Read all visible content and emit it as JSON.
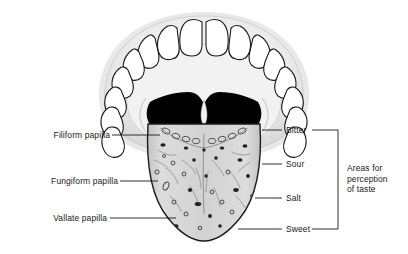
{
  "figure": {
    "background_color": "#ffffff",
    "line_color": "#1a1a1a",
    "text_color": "#1a1a1a",
    "tongue_fill": "#d0d0d0",
    "mouth_fill": "#ededed",
    "teeth_fill": "#ffffff",
    "throat_fill": "#000000"
  },
  "left_labels": [
    {
      "id": "filiform",
      "text": "Filiform papilla"
    },
    {
      "id": "fungiform",
      "text": "Fungiform papilla"
    },
    {
      "id": "vallate",
      "text": "Vallate papilla"
    }
  ],
  "right_labels": [
    {
      "id": "bitter",
      "text": "Bitter"
    },
    {
      "id": "sour",
      "text": "Sour"
    },
    {
      "id": "salt",
      "text": "Salt"
    },
    {
      "id": "sweet",
      "text": "Sweet"
    }
  ],
  "bracket_label": {
    "line1": "Areas for",
    "line2": "perception",
    "line3": "of taste"
  }
}
